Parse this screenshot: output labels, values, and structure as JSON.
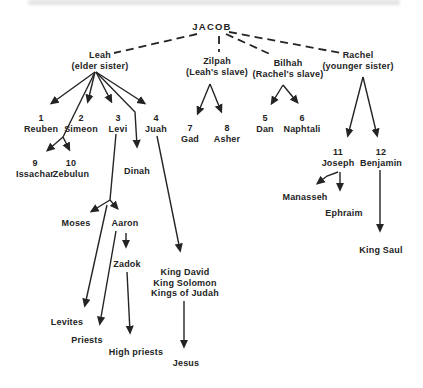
{
  "colors": {
    "background": "#ffffff",
    "ink": "#242424",
    "redaction": "#dcdcdc"
  },
  "diagram": {
    "root": {
      "label": "JACOB"
    },
    "mothers": [
      {
        "name": "Leah",
        "subtitle": "(elder sister)"
      },
      {
        "name": "Zilpah",
        "subtitle": "(Leah's slave)"
      },
      {
        "name": "Bilhah",
        "subtitle": "(Rachel's slave)"
      },
      {
        "name": "Rachel",
        "subtitle": "(younger sister)"
      }
    ],
    "sons": [
      {
        "num": "1",
        "name": "Reuben"
      },
      {
        "num": "2",
        "name": "Simeon"
      },
      {
        "num": "3",
        "name": "Levi"
      },
      {
        "num": "4",
        "name": "Juah"
      },
      {
        "num": "5",
        "name": "Dan"
      },
      {
        "num": "6",
        "name": "Naphtali"
      },
      {
        "num": "7",
        "name": "Gad"
      },
      {
        "num": "8",
        "name": "Asher"
      },
      {
        "num": "9",
        "name": "Issachar"
      },
      {
        "num": "10",
        "name": "Zebulun"
      },
      {
        "num": "11",
        "name": "Joseph"
      },
      {
        "num": "12",
        "name": "Benjamin"
      }
    ],
    "daughter": {
      "name": "Dinah"
    },
    "descendants": {
      "moses": "Moses",
      "aaron": "Aaron",
      "zadok": "Zadok",
      "manasseh": "Manasseh",
      "ephraim": "Ephraim",
      "king_saul": "King Saul",
      "levites": "Levites",
      "priests": "Priests",
      "high_priests": "High priests",
      "jesus": "Jesus"
    },
    "davidic_line": {
      "lines": [
        "King David",
        "King Solomon",
        "Kings of Judah"
      ]
    }
  }
}
